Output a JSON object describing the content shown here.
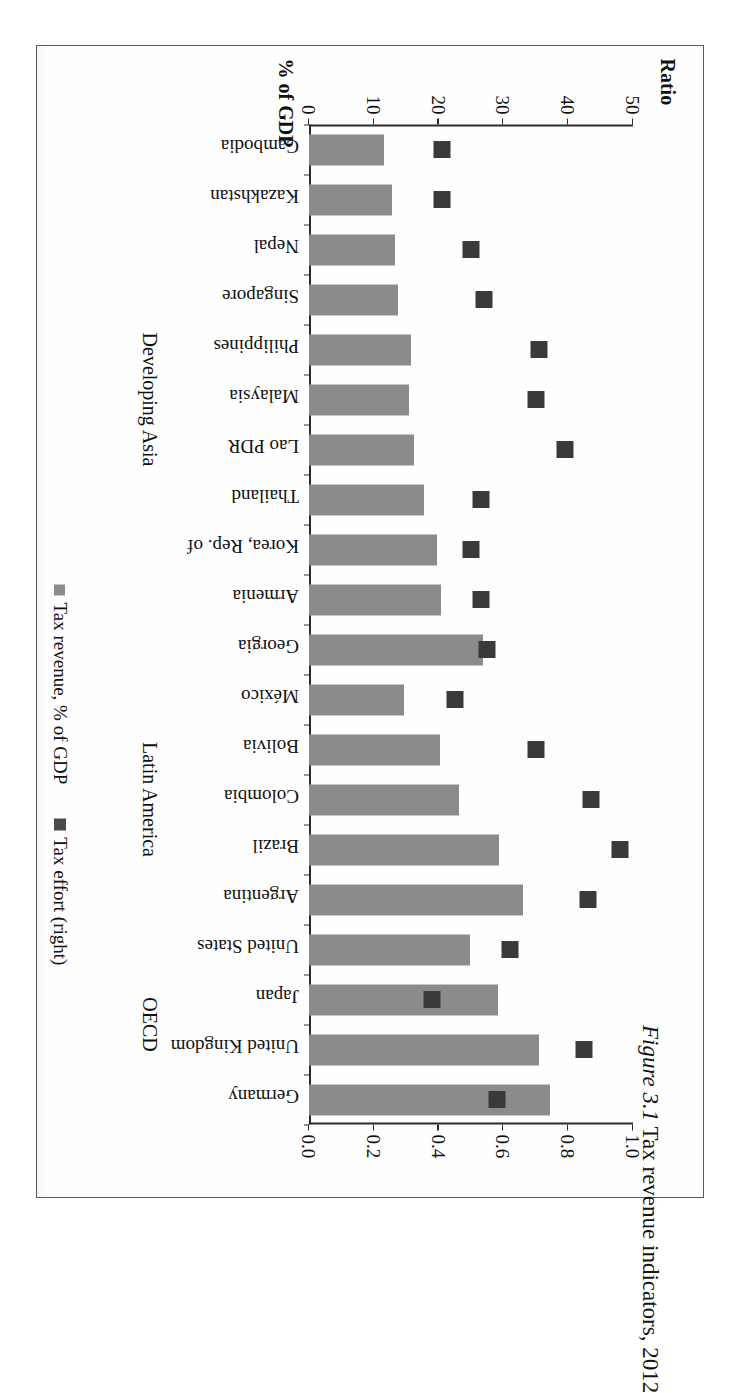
{
  "caption": {
    "number": "Figure 3.1",
    "text": "Tax revenue indicators, 2012"
  },
  "axes": {
    "left_title": "% of GDP",
    "right_title": "Ratio",
    "gdp_ticks": [
      "0",
      "10",
      "20",
      "30",
      "40",
      "50"
    ],
    "ratio_ticks": [
      "0.0",
      "0.2",
      "0.4",
      "0.6",
      "0.8",
      "1.0"
    ]
  },
  "legend": {
    "items": [
      {
        "label": "Tax revenue, % of GDP",
        "swatch": "bar-swatch",
        "color": "#8b8b8b"
      },
      {
        "label": "Tax effort (right)",
        "swatch": "marker-swatch",
        "color": "#4a4a4a"
      }
    ]
  },
  "groups": [
    {
      "name": "Developing Asia",
      "label": "Developing Asia"
    },
    {
      "name": "Latin America",
      "label": "Latin America"
    },
    {
      "name": "OECD",
      "label": "OECD"
    }
  ],
  "chart_data": {
    "type": "bar",
    "title": "Tax revenue indicators, 2012",
    "orientation": "vertical-bars-rotated",
    "xlabel": "",
    "ylabel": "% of GDP",
    "y2label": "Ratio",
    "ylim": [
      0,
      50
    ],
    "y2lim": [
      0,
      1.0
    ],
    "grid": false,
    "legend_position": "bottom",
    "categories": [
      "Cambodia",
      "Kazakhstan",
      "Nepal",
      "Singapore",
      "Philippines",
      "Malaysia",
      "Lao PDR",
      "Thailand",
      "Korea, Rep. of",
      "Armenia",
      "Georgia",
      "México",
      "Bolivia",
      "Colombia",
      "Brazil",
      "Argentina",
      "United States",
      "Japan",
      "United Kingdom",
      "Germany"
    ],
    "category_groups": [
      "Developing Asia",
      "Developing Asia",
      "Developing Asia",
      "Developing Asia",
      "Developing Asia",
      "Developing Asia",
      "Developing Asia",
      "Developing Asia",
      "Developing Asia",
      "Developing Asia",
      "Developing Asia",
      "Latin America",
      "Latin America",
      "Latin America",
      "Latin America",
      "Latin America",
      "OECD",
      "OECD",
      "OECD",
      "OECD"
    ],
    "series": [
      {
        "name": "Tax revenue, % of GDP",
        "axis": "left",
        "type": "bar",
        "color": "#8b8b8b",
        "values": [
          11.5,
          12.8,
          13.2,
          13.8,
          15.8,
          15.5,
          16.2,
          17.8,
          19.8,
          20.4,
          26.8,
          14.6,
          20.2,
          23.2,
          29.4,
          33.0,
          24.8,
          29.2,
          35.5,
          37.2
        ]
      },
      {
        "name": "Tax effort (right)",
        "axis": "right",
        "type": "scatter",
        "color": "#3a3a3a",
        "values": [
          0.41,
          0.41,
          0.5,
          0.54,
          0.71,
          0.7,
          0.79,
          0.53,
          0.5,
          0.53,
          0.55,
          0.45,
          0.7,
          0.87,
          0.96,
          0.86,
          0.62,
          0.38,
          0.85,
          0.58
        ]
      }
    ],
    "gdp_axis_ticks": [
      0,
      10,
      20,
      30,
      40,
      50
    ],
    "ratio_axis_ticks": [
      0.0,
      0.2,
      0.4,
      0.6,
      0.8,
      1.0
    ]
  }
}
